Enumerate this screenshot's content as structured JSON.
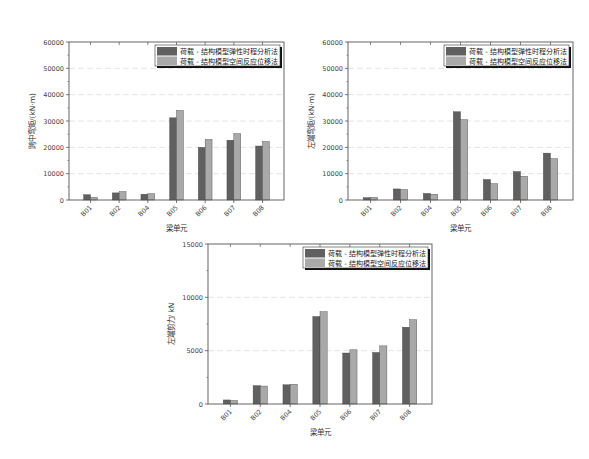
{
  "legend": {
    "series1": "荷载 - 结构模型弹性时程分析法",
    "series2": "荷载 - 结构模型空间反应位移法"
  },
  "colors": {
    "series1": "#606060",
    "series2": "#a9a9a9"
  },
  "chart_data": [
    {
      "type": "bar",
      "title": "",
      "xlabel": "梁单元",
      "ylabel": "跨中弯矩/(kN·m)",
      "ylim": [
        0,
        60000
      ],
      "yticks": [
        0,
        10000,
        20000,
        30000,
        40000,
        50000,
        60000
      ],
      "grid": true,
      "legend_position": "upper right",
      "categories": [
        "B01",
        "B02",
        "B04",
        "B05",
        "B06",
        "B07",
        "B08"
      ],
      "series": [
        {
          "name": "荷载 - 结构模型弹性时程分析法",
          "values": [
            2000,
            2700,
            2200,
            31200,
            20000,
            22700,
            20500
          ]
        },
        {
          "name": "荷载 - 结构模型空间反应位移法",
          "values": [
            1000,
            3200,
            2400,
            34000,
            23000,
            25200,
            22200
          ]
        }
      ]
    },
    {
      "type": "bar",
      "title": "",
      "xlabel": "梁单元",
      "ylabel": "左端弯矩/(kN·m)",
      "ylim": [
        0,
        60000
      ],
      "yticks": [
        0,
        10000,
        20000,
        30000,
        40000,
        50000,
        60000
      ],
      "grid": true,
      "legend_position": "upper right",
      "categories": [
        "B01",
        "B02",
        "B04",
        "B05",
        "B06",
        "B07",
        "B08"
      ],
      "series": [
        {
          "name": "荷载 - 结构模型弹性时程分析法",
          "values": [
            900,
            4200,
            2500,
            33500,
            7800,
            10800,
            17800
          ]
        },
        {
          "name": "荷载 - 结构模型空间反应位移法",
          "values": [
            1000,
            4000,
            2200,
            30500,
            6200,
            9000,
            15700
          ]
        }
      ]
    },
    {
      "type": "bar",
      "title": "",
      "xlabel": "梁单元",
      "ylabel": "左端剪力/ kN",
      "ylim": [
        0,
        15000
      ],
      "yticks": [
        0,
        5000,
        10000,
        15000
      ],
      "grid": true,
      "legend_position": "upper right",
      "categories": [
        "B01",
        "B02",
        "B04",
        "B05",
        "B06",
        "B07",
        "B08"
      ],
      "series": [
        {
          "name": "荷载 - 结构模型弹性时程分析法",
          "values": [
            380,
            1720,
            1800,
            8200,
            4780,
            4830,
            7200
          ]
        },
        {
          "name": "荷载 - 结构模型空间反应位移法",
          "values": [
            330,
            1680,
            1850,
            8650,
            5080,
            5450,
            7900
          ]
        }
      ]
    }
  ],
  "layout": [
    {
      "frame": [
        69,
        42,
        284,
        200
      ],
      "minor": 2
    },
    {
      "frame": [
        348,
        42,
        573,
        200
      ],
      "minor": 2
    },
    {
      "frame": [
        208,
        244,
        432,
        404
      ],
      "minor": 2
    }
  ]
}
